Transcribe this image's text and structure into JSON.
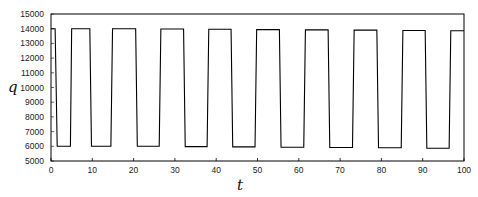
{
  "chart_data": {
    "type": "line",
    "title": "",
    "xlabel": "t",
    "ylabel": "q",
    "xlim": [
      0,
      100
    ],
    "ylim": [
      5000,
      15000
    ],
    "xticks": [
      0,
      10,
      20,
      30,
      40,
      50,
      60,
      70,
      80,
      90,
      100
    ],
    "yticks": [
      5000,
      6000,
      7000,
      8000,
      9000,
      10000,
      11000,
      12000,
      13000,
      14000,
      15000
    ],
    "xtick_labels": [
      "0",
      "10",
      "20",
      "30",
      "40",
      "50",
      "60",
      "70",
      "80",
      "90",
      "100"
    ],
    "ytick_labels": [
      "5000",
      "6000",
      "7000",
      "8000",
      "9000",
      "10000",
      "11000",
      "12000",
      "13000",
      "14000",
      "15000"
    ],
    "grid": false,
    "legend": null,
    "frame": "box",
    "series": [
      {
        "name": "q(t)",
        "color": "#000000",
        "description": "Square-wave-like oscillation between ~14000 and ~6000, period ~11.7",
        "x": [
          0,
          1.0,
          1.5,
          4.7,
          5.0,
          9.4,
          9.8,
          14.5,
          14.9,
          20.5,
          20.9,
          26.2,
          26.6,
          32.1,
          32.5,
          37.8,
          38.2,
          43.6,
          44.0,
          49.4,
          49.8,
          55.3,
          55.7,
          61.2,
          61.6,
          67.1,
          67.5,
          73.0,
          73.4,
          78.9,
          79.3,
          84.8,
          85.2,
          90.6,
          91.0,
          96.4,
          96.8,
          100
        ],
        "y": [
          14000,
          14000,
          6000,
          6000,
          14000,
          14000,
          6000,
          6000,
          14000,
          14000,
          6000,
          6000,
          13980,
          13980,
          5980,
          5980,
          13960,
          13960,
          5960,
          5960,
          13940,
          13940,
          5940,
          5940,
          13920,
          13920,
          5920,
          5920,
          13900,
          13900,
          5900,
          5900,
          13880,
          13880,
          5870,
          5870,
          13860,
          13860
        ]
      }
    ]
  }
}
